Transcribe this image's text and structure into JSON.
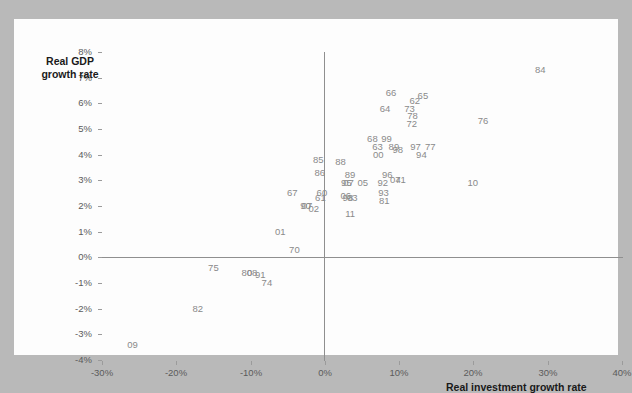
{
  "figure": {
    "background_color": "#b9b9b9",
    "card_color": "#fdfdfd",
    "label_color": "#8a8a8a",
    "axis_color": "#8f8f8f"
  },
  "chart_data": {
    "type": "scatter",
    "title": "",
    "xlabel": "Real investment growth rate",
    "ylabel_line1": "Real GDP",
    "ylabel_line2": "growth rate",
    "xlim": [
      -30,
      40
    ],
    "ylim": [
      -4,
      8
    ],
    "xticks": [
      "-30%",
      "-20%",
      "-10%",
      "0%",
      "10%",
      "20%",
      "30%",
      "40%"
    ],
    "xtick_values": [
      -30,
      -20,
      -10,
      0,
      10,
      20,
      30,
      40
    ],
    "yticks": [
      "8%",
      "7%",
      "6%",
      "5%",
      "4%",
      "3%",
      "2%",
      "1%",
      "0%",
      "-1%",
      "-2%",
      "-3%",
      "-4%"
    ],
    "ytick_values": [
      8,
      7,
      6,
      5,
      4,
      3,
      2,
      1,
      0,
      -1,
      -2,
      -3,
      -4
    ],
    "grid": false,
    "legend": "none",
    "marker_style": "text-label",
    "points": [
      {
        "label": "84",
        "x": 29.0,
        "y": 7.3
      },
      {
        "label": "66",
        "x": 8.9,
        "y": 6.4
      },
      {
        "label": "65",
        "x": 13.2,
        "y": 6.3
      },
      {
        "label": "62",
        "x": 12.1,
        "y": 6.1
      },
      {
        "label": "64",
        "x": 8.1,
        "y": 5.8
      },
      {
        "label": "73",
        "x": 11.4,
        "y": 5.8
      },
      {
        "label": "78",
        "x": 11.8,
        "y": 5.5
      },
      {
        "label": "76",
        "x": 21.3,
        "y": 5.3
      },
      {
        "label": "72",
        "x": 11.7,
        "y": 5.2
      },
      {
        "label": "68",
        "x": 6.4,
        "y": 4.6
      },
      {
        "label": "99",
        "x": 8.3,
        "y": 4.6
      },
      {
        "label": "63",
        "x": 7.1,
        "y": 4.3
      },
      {
        "label": "89",
        "x": 9.3,
        "y": 4.3
      },
      {
        "label": "98",
        "x": 9.8,
        "y": 4.2
      },
      {
        "label": "97",
        "x": 12.2,
        "y": 4.3
      },
      {
        "label": "77",
        "x": 14.2,
        "y": 4.3
      },
      {
        "label": "00",
        "x": 7.2,
        "y": 4.0
      },
      {
        "label": "94",
        "x": 13.0,
        "y": 4.0
      },
      {
        "label": "85",
        "x": -0.9,
        "y": 3.8
      },
      {
        "label": "88",
        "x": 2.1,
        "y": 3.7
      },
      {
        "label": "86",
        "x": -0.7,
        "y": 3.3
      },
      {
        "label": "89b",
        "display": "89",
        "x": 3.4,
        "y": 3.2
      },
      {
        "label": "96",
        "x": 8.4,
        "y": 3.2
      },
      {
        "label": "04",
        "x": 9.5,
        "y": 3.0
      },
      {
        "label": "71",
        "x": 10.2,
        "y": 3.0
      },
      {
        "label": "92",
        "x": 7.8,
        "y": 2.9
      },
      {
        "label": "95",
        "x": 2.9,
        "y": 2.9
      },
      {
        "label": "07",
        "x": 3.2,
        "y": 2.9
      },
      {
        "label": "05",
        "x": 5.1,
        "y": 2.9
      },
      {
        "label": "10",
        "x": 19.9,
        "y": 2.9
      },
      {
        "label": "93",
        "x": 7.9,
        "y": 2.5
      },
      {
        "label": "06",
        "x": 2.8,
        "y": 2.4
      },
      {
        "label": "98b",
        "display": "98",
        "x": 3.1,
        "y": 2.3
      },
      {
        "label": "03",
        "x": 3.7,
        "y": 2.3
      },
      {
        "label": "81",
        "x": 8.0,
        "y": 2.2
      },
      {
        "label": "67",
        "x": -4.4,
        "y": 2.5
      },
      {
        "label": "60",
        "x": -0.4,
        "y": 2.5
      },
      {
        "label": "61",
        "x": -0.6,
        "y": 2.3
      },
      {
        "label": "90",
        "x": -2.6,
        "y": 2.0
      },
      {
        "label": "07b",
        "display": "07",
        "x": -2.4,
        "y": 2.0
      },
      {
        "label": "02",
        "x": -1.5,
        "y": 1.9
      },
      {
        "label": "11",
        "x": 3.4,
        "y": 1.7
      },
      {
        "label": "01",
        "x": -6.0,
        "y": 1.0
      },
      {
        "label": "70",
        "x": -4.1,
        "y": 0.3
      },
      {
        "label": "75",
        "x": -15.0,
        "y": -0.4
      },
      {
        "label": "80",
        "x": -10.5,
        "y": -0.6
      },
      {
        "label": "08",
        "x": -9.8,
        "y": -0.6
      },
      {
        "label": "91",
        "x": -8.7,
        "y": -0.7
      },
      {
        "label": "74",
        "x": -7.8,
        "y": -1.0
      },
      {
        "label": "82",
        "x": -17.1,
        "y": -2.0
      },
      {
        "label": "09",
        "x": -25.9,
        "y": -3.4
      }
    ]
  }
}
